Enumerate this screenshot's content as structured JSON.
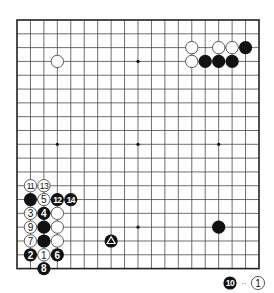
{
  "diagram": {
    "type": "go-board",
    "size": 19,
    "colors": {
      "line": "#4a4a4a",
      "border": "#222222",
      "black": "#111111",
      "white": "#ffffff",
      "stone_outline": "#333333"
    },
    "star_points": [
      [
        3,
        3
      ],
      [
        9,
        3
      ],
      [
        15,
        3
      ],
      [
        3,
        9
      ],
      [
        9,
        9
      ],
      [
        15,
        9
      ],
      [
        3,
        15
      ],
      [
        9,
        15
      ],
      [
        15,
        15
      ]
    ],
    "stones": [
      {
        "col": 3,
        "row": 3,
        "color": "white",
        "label": ""
      },
      {
        "col": 13,
        "row": 2,
        "color": "white",
        "label": ""
      },
      {
        "col": 15,
        "row": 2,
        "color": "white",
        "label": ""
      },
      {
        "col": 16,
        "row": 2,
        "color": "white",
        "label": ""
      },
      {
        "col": 17,
        "row": 2,
        "color": "black",
        "label": ""
      },
      {
        "col": 13,
        "row": 3,
        "color": "white",
        "label": ""
      },
      {
        "col": 14,
        "row": 3,
        "color": "black",
        "label": ""
      },
      {
        "col": 15,
        "row": 3,
        "color": "black",
        "label": ""
      },
      {
        "col": 16,
        "row": 3,
        "color": "black",
        "label": ""
      },
      {
        "col": 15,
        "row": 15,
        "color": "black",
        "label": ""
      },
      {
        "col": 7,
        "row": 16,
        "color": "black",
        "label": "",
        "mark": "triangle"
      },
      {
        "col": 1,
        "row": 12,
        "color": "white",
        "label": "11"
      },
      {
        "col": 2,
        "row": 12,
        "color": "white",
        "label": "13"
      },
      {
        "col": 1,
        "row": 13,
        "color": "black",
        "label": ""
      },
      {
        "col": 2,
        "row": 13,
        "color": "white",
        "label": "5"
      },
      {
        "col": 3,
        "row": 13,
        "color": "black",
        "label": "12"
      },
      {
        "col": 4,
        "row": 13,
        "color": "black",
        "label": "14"
      },
      {
        "col": 1,
        "row": 14,
        "color": "white",
        "label": "3"
      },
      {
        "col": 2,
        "row": 14,
        "color": "black",
        "label": "4"
      },
      {
        "col": 3,
        "row": 14,
        "color": "white",
        "label": ""
      },
      {
        "col": 1,
        "row": 15,
        "color": "white",
        "label": "9"
      },
      {
        "col": 2,
        "row": 15,
        "color": "black",
        "label": ""
      },
      {
        "col": 3,
        "row": 15,
        "color": "white",
        "label": ""
      },
      {
        "col": 1,
        "row": 16,
        "color": "white",
        "label": "7"
      },
      {
        "col": 2,
        "row": 16,
        "color": "black",
        "label": ""
      },
      {
        "col": 3,
        "row": 16,
        "color": "white",
        "label": ""
      },
      {
        "col": 1,
        "row": 17,
        "color": "black",
        "label": "2"
      },
      {
        "col": 2,
        "row": 17,
        "color": "white",
        "label": "1"
      },
      {
        "col": 3,
        "row": 17,
        "color": "black",
        "label": "6"
      },
      {
        "col": 2,
        "row": 18,
        "color": "black",
        "label": "8"
      }
    ]
  },
  "caption": {
    "first_stone": {
      "color": "black",
      "label": "10"
    },
    "separator": "··",
    "second_stone": {
      "color": "white",
      "label": "1"
    }
  }
}
